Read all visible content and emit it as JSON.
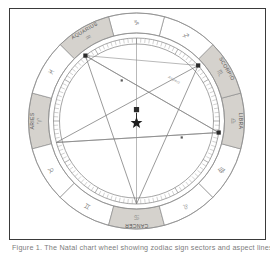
{
  "figure": {
    "caption": "Figure 1. The Natal chart wheel showing zodiac sign sectors and aspect lines."
  },
  "colors": {
    "frame_border": "#3a3a3a",
    "shaded_sector": "#d5d2cd",
    "plain_sector": "#ffffff",
    "ring_stroke": "#8e8e8e",
    "aspect_line": "#8a8a8a",
    "marker_dark": "#2b2b2b",
    "label_text": "#555555",
    "glyph_text": "#8a8a8a"
  },
  "chart_data": {
    "type": "pie",
    "subtitle": "Twelve zodiac sectors with pentagram aspect pattern",
    "legend_position": "none",
    "grid": false,
    "categories": [
      "Aries",
      "Taurus",
      "Gemini",
      "Cancer",
      "Leo",
      "Virgo",
      "Libra",
      "Scorpio",
      "Sagittarius",
      "Capricorn",
      "Aquarius",
      "Pisces"
    ],
    "values": [
      30,
      30,
      30,
      30,
      30,
      30,
      30,
      30,
      30,
      30,
      30,
      30
    ],
    "xlabel": "",
    "ylabel": "",
    "units": "degrees",
    "sectors": [
      {
        "name": "ARIES",
        "glyph": "♈",
        "start_deg": 165,
        "end_deg": 195,
        "shaded": true,
        "labeled": true
      },
      {
        "name": "TAURUS",
        "glyph": "♉",
        "start_deg": 195,
        "end_deg": 225,
        "shaded": false,
        "labeled": false
      },
      {
        "name": "GEMINI",
        "glyph": "♊",
        "start_deg": 225,
        "end_deg": 255,
        "shaded": false,
        "labeled": false
      },
      {
        "name": "CANCER",
        "glyph": "♋",
        "start_deg": 255,
        "end_deg": 285,
        "shaded": true,
        "labeled": true
      },
      {
        "name": "LEO",
        "glyph": "♌",
        "start_deg": 285,
        "end_deg": 315,
        "shaded": false,
        "labeled": false
      },
      {
        "name": "VIRGO",
        "glyph": "♍",
        "start_deg": 315,
        "end_deg": 345,
        "shaded": false,
        "labeled": false
      },
      {
        "name": "LIBRA",
        "glyph": "♎",
        "start_deg": 345,
        "end_deg": 15,
        "shaded": true,
        "labeled": true
      },
      {
        "name": "SCORPIO",
        "glyph": "♏",
        "start_deg": 15,
        "end_deg": 45,
        "shaded": true,
        "labeled": true
      },
      {
        "name": "SAGITTARIUS",
        "glyph": "♐",
        "start_deg": 45,
        "end_deg": 75,
        "shaded": false,
        "labeled": false
      },
      {
        "name": "CAPRICORN",
        "glyph": "♑",
        "start_deg": 75,
        "end_deg": 105,
        "shaded": false,
        "labeled": false
      },
      {
        "name": "AQUARIUS",
        "glyph": "♒",
        "start_deg": 105,
        "end_deg": 135,
        "shaded": true,
        "labeled": true
      },
      {
        "name": "PISCES",
        "glyph": "♓",
        "start_deg": 135,
        "end_deg": 165,
        "shaded": false,
        "labeled": false
      }
    ],
    "markers": [
      {
        "name": "node-upper-left",
        "type": "square",
        "angle_deg": 128,
        "radius_frac": 1.0
      },
      {
        "name": "node-upper-right",
        "type": "square",
        "angle_deg": 42,
        "radius_frac": 1.0
      },
      {
        "name": "node-right",
        "type": "square",
        "angle_deg": 352,
        "radius_frac": 1.0
      },
      {
        "name": "point-inner-upper",
        "type": "dot",
        "angle_deg": 110,
        "radius_frac": 0.52
      },
      {
        "name": "point-inner-right",
        "type": "dot",
        "angle_deg": 340,
        "radius_frac": 0.58
      }
    ],
    "center_symbols": [
      {
        "name": "center-square",
        "glyph": "square"
      },
      {
        "name": "center-star",
        "glyph": "star"
      }
    ],
    "aspect_label": "Aspect"
  },
  "labels": {
    "aries": "ARIES",
    "cancer": "CANCER",
    "libra": "LIBRA",
    "scorpio": "SCORPIO",
    "aquarius": "AQUARIUS"
  }
}
